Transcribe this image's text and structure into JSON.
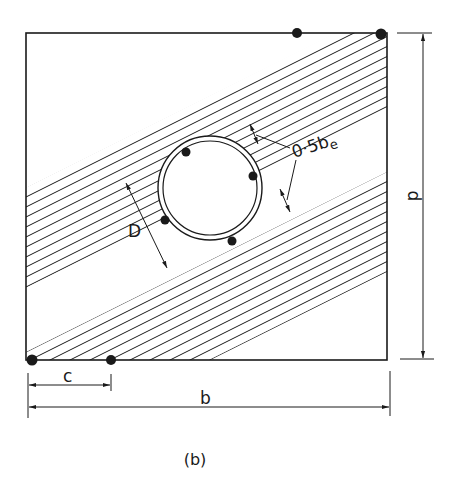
{
  "figure": {
    "caption": "(b)"
  },
  "labels": {
    "duct_diameter": "D",
    "effective_width": "0·5b",
    "effective_width_subscript": "e",
    "depth": "d",
    "width": "b",
    "cover": "c"
  },
  "elements": {
    "section": {
      "x": 26,
      "y": 33,
      "width": 361,
      "height": 327
    },
    "duct": {
      "cx": 210,
      "cy": 188,
      "outer_r": 52,
      "inner_r": 47
    },
    "bars_on_duct": 4,
    "corner_bars": [
      "top-middle",
      "top-right",
      "bottom-left",
      "bottom-near-c"
    ],
    "hatch_slope": -0.5
  },
  "colors": {
    "ink": "#1a1a1a",
    "paper": "#ffffff"
  }
}
